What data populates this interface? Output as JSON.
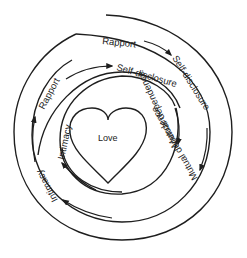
{
  "diagram": {
    "center_label": "Love",
    "outer_ring": {
      "labels": [
        "Rapport",
        "Self-disclosure",
        "Mutual dependence",
        "Intimacy"
      ]
    },
    "inner_ring": {
      "labels": [
        "Rapport",
        "Self-disclosure",
        "Mutual dependence",
        "Intimacy"
      ]
    },
    "colors": {
      "line": "#1e1e1e",
      "text": "#222222",
      "background": "#ffffff"
    }
  }
}
